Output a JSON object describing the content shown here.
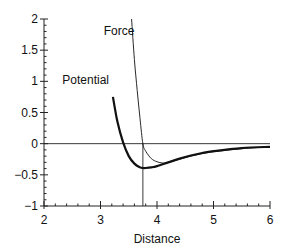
{
  "chart_data": {
    "type": "line",
    "title": "",
    "xlabel": "Distance",
    "ylabel": "",
    "xlim": [
      2,
      6
    ],
    "ylim": [
      -1,
      2
    ],
    "xticks": [
      2,
      3,
      4,
      5,
      6
    ],
    "xtick_labels": [
      "2",
      "3",
      "4",
      "5",
      "6"
    ],
    "yticks": [
      -1,
      -0.5,
      0,
      0.5,
      1,
      1.5,
      2
    ],
    "ytick_labels": [
      "−1",
      "−0.5",
      "0",
      "0.5",
      "1",
      "1.5",
      "2"
    ],
    "grid": false,
    "legend": "inline labels",
    "annotations": [
      {
        "text": "Force",
        "x": 3.6,
        "y": 1.75
      },
      {
        "text": "Potential",
        "x": 3.15,
        "y": 0.95
      }
    ],
    "reference_lines": {
      "horizontal_y": 0,
      "vertical_x": 3.75,
      "vertical_from_y": -1,
      "vertical_to_y": 0
    },
    "series": [
      {
        "name": "Force",
        "style": "thin",
        "x": [
          3.55,
          3.6,
          3.65,
          3.7,
          3.75,
          3.8,
          3.9,
          4.0,
          4.1,
          4.2,
          4.4,
          4.6,
          4.8,
          5.0,
          5.5,
          6.0
        ],
        "y": [
          2.0,
          1.35,
          0.85,
          0.4,
          0.0,
          -0.12,
          -0.24,
          -0.29,
          -0.31,
          -0.3,
          -0.25,
          -0.2,
          -0.16,
          -0.13,
          -0.08,
          -0.05
        ]
      },
      {
        "name": "Potential",
        "style": "thick",
        "x": [
          3.22,
          3.3,
          3.4,
          3.5,
          3.6,
          3.7,
          3.75,
          3.8,
          3.9,
          4.0,
          4.2,
          4.4,
          4.6,
          4.8,
          5.0,
          5.5,
          6.0
        ],
        "y": [
          0.75,
          0.35,
          0.02,
          -0.2,
          -0.32,
          -0.38,
          -0.39,
          -0.39,
          -0.38,
          -0.36,
          -0.3,
          -0.24,
          -0.19,
          -0.15,
          -0.12,
          -0.07,
          -0.05
        ]
      }
    ]
  }
}
